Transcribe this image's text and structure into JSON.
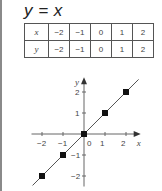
{
  "title": "y = x",
  "table": {
    "rows": [
      {
        "label": "x",
        "values": [
          "−2",
          "−1",
          "0",
          "1",
          "2"
        ]
      },
      {
        "label": "y",
        "values": [
          "−2",
          "−1",
          "0",
          "1",
          "2"
        ]
      }
    ]
  },
  "chart_data": {
    "type": "line",
    "title": "y = x",
    "xlabel": "x",
    "ylabel": "y",
    "x": [
      -2,
      -1,
      0,
      1,
      2
    ],
    "series": [
      {
        "name": "y = x",
        "values": [
          -2,
          -1,
          0,
          1,
          2
        ],
        "markers": true
      }
    ],
    "xlim": [
      -2.5,
      2.7
    ],
    "ylim": [
      -2.5,
      2.7
    ],
    "xticks": [
      "−2",
      "−1",
      "0",
      "1",
      "2"
    ],
    "yticks": [
      "−2",
      "−1",
      "1",
      "2"
    ],
    "grid": false,
    "line_color": "#555555",
    "marker_color": "#111111"
  }
}
